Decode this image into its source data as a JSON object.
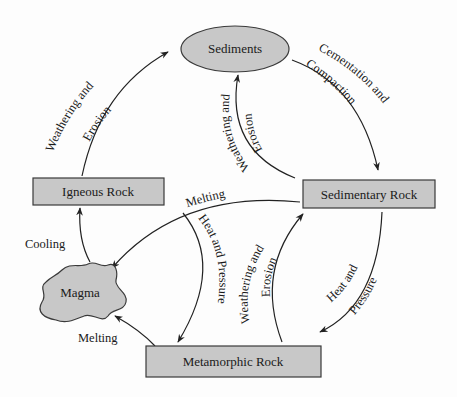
{
  "colors": {
    "node_fill": "#c8c8c8",
    "node_stroke": "#3a3a3a",
    "arrow": "#222222",
    "text": "#1a1a1a",
    "background": "#fdfdfd"
  },
  "nodes": {
    "sediments": "Sediments",
    "igneous": "Igneous Rock",
    "sedimentary": "Sedimentary Rock",
    "magma": "Magma",
    "metamorphic": "Metamorphic Rock"
  },
  "edges": {
    "igneous_to_sediments": {
      "line1": "Weathering and",
      "line2": "Erosion"
    },
    "sediments_to_sedimentary": {
      "line1": "Cementation and",
      "line2": "Compaction"
    },
    "sedimentary_to_sediments": {
      "line1": "Weathering and",
      "line2": "Erosion"
    },
    "sedimentary_to_magma": {
      "label": "Melting"
    },
    "sedimentary_to_metamorphic_inner": {
      "label": "Heat and Pressure"
    },
    "metamorphic_to_sedimentary": {
      "line1": "Weathering and",
      "line2": "Erosion"
    },
    "sedimentary_to_metamorphic_outer": {
      "line1": "Heat and",
      "line2": "Pressure"
    },
    "magma_to_igneous": {
      "label": "Cooling"
    },
    "metamorphic_to_magma": {
      "label": "Melting"
    }
  }
}
